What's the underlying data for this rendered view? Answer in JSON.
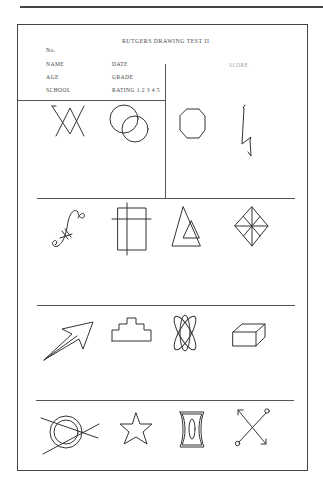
{
  "header": {
    "title": "RUTGERS DRAWING TEST II",
    "number_label": "No.",
    "fields_left": [
      "NAME",
      "AGE",
      "SCHOOL"
    ],
    "fields_right": [
      "DATE",
      "GRADE",
      "RATING 1 2 3 4 5"
    ],
    "score_label": "SCORE"
  },
  "figures": {
    "row1": [
      "interlaced-v-triangles",
      "overlapping-circles",
      "octagon",
      "zigzag-line"
    ],
    "row2": [
      "s-curve-with-crossbars",
      "rectangle-with-crossing-lines",
      "nested-triangles",
      "diamond-with-spokes"
    ],
    "row3": [
      "outlined-arrow",
      "stepped-pyramid",
      "atom-ellipses",
      "rectangular-box"
    ],
    "row4": [
      "double-circle-with-crossing-lines",
      "five-point-star",
      "concave-frame-with-oval",
      "crossed-arrows-with-circles"
    ]
  }
}
